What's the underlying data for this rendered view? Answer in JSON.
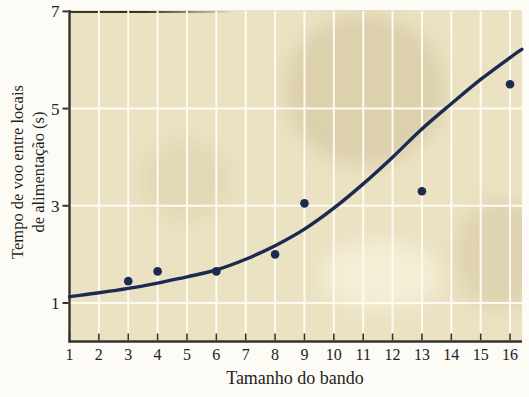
{
  "figure": {
    "page_bg": "#fcfbf6",
    "plot_bg": "#ebe2c3",
    "grid_color": "#fdfbf0",
    "axis_color": "#34332e",
    "navy": "#1c2a52",
    "text_color": "#23221f"
  },
  "chart_data": {
    "type": "scatter",
    "title": "",
    "xlabel": "Tamanho do bando",
    "ylabel_lines": [
      "Tempo de voo entre locais",
      "de alimentação (s)"
    ],
    "x_ticks": [
      1,
      2,
      3,
      4,
      5,
      6,
      7,
      8,
      9,
      10,
      11,
      12,
      13,
      14,
      15,
      16
    ],
    "y_ticks": [
      1,
      3,
      5,
      7
    ],
    "xlim": [
      1,
      16.4
    ],
    "ylim": [
      0.2,
      7
    ],
    "grid": "on",
    "legend": "none",
    "points": [
      [
        3,
        1.45
      ],
      [
        4,
        1.65
      ],
      [
        6,
        1.65
      ],
      [
        8,
        2.0
      ],
      [
        9,
        3.05
      ],
      [
        13,
        3.3
      ],
      [
        16,
        5.5
      ]
    ],
    "curve_fit": [
      [
        1,
        1.13
      ],
      [
        2,
        1.21
      ],
      [
        3,
        1.3
      ],
      [
        4,
        1.41
      ],
      [
        5,
        1.54
      ],
      [
        6,
        1.68
      ],
      [
        7,
        1.9
      ],
      [
        8,
        2.18
      ],
      [
        9,
        2.52
      ],
      [
        10,
        2.95
      ],
      [
        11,
        3.45
      ],
      [
        12,
        4.0
      ],
      [
        13,
        4.58
      ],
      [
        14,
        5.1
      ],
      [
        15,
        5.6
      ],
      [
        16,
        6.05
      ],
      [
        16.4,
        6.22
      ]
    ]
  }
}
